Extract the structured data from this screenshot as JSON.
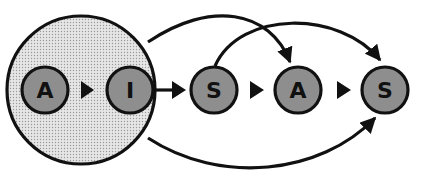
{
  "diagram": {
    "colors": {
      "background": "#ffffff",
      "stroke": "#111111",
      "node_fill": "#8e8e8e",
      "group_fill": "#e6e6e6",
      "group_dot": "#9a9a9a"
    },
    "group": {
      "members": [
        "A",
        "I"
      ],
      "pattern": "dotted"
    },
    "nodes": [
      {
        "label": "A"
      },
      {
        "label": "I"
      },
      {
        "label": "S"
      },
      {
        "label": "A"
      },
      {
        "label": "S"
      }
    ],
    "edges": [
      {
        "from": 0,
        "to": 1,
        "type": "straight"
      },
      {
        "from": "group",
        "to": 2,
        "type": "straight"
      },
      {
        "from": 2,
        "to": 3,
        "type": "straight"
      },
      {
        "from": 3,
        "to": 4,
        "type": "straight"
      },
      {
        "from": "group",
        "to": 3,
        "type": "arc-top"
      },
      {
        "from": 2,
        "to": 4,
        "type": "arc-top"
      },
      {
        "from": "group",
        "to": 4,
        "type": "arc-bottom"
      }
    ]
  }
}
